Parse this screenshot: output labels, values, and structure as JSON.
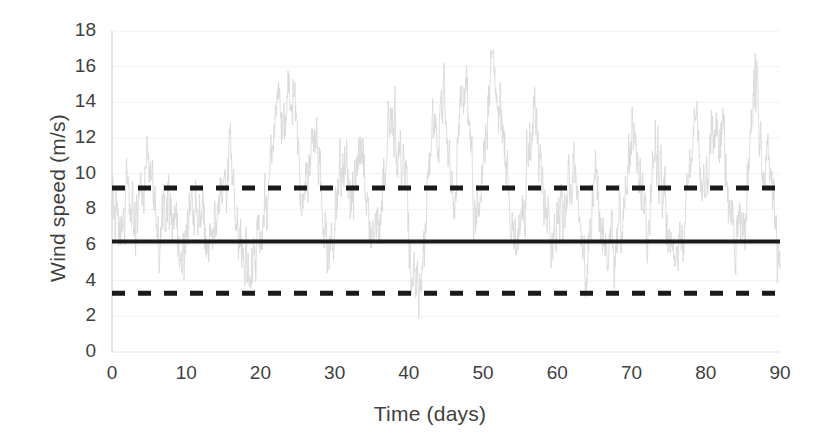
{
  "chart_data": {
    "type": "line",
    "title": "",
    "subtitle": "",
    "xlabel": "Time (days)",
    "ylabel": "Wind speed (m/s)",
    "xlim": [
      0,
      90
    ],
    "ylim": [
      0,
      18
    ],
    "xticks": [
      0,
      10,
      20,
      30,
      40,
      50,
      60,
      70,
      80,
      90
    ],
    "yticks": [
      0,
      2,
      4,
      6,
      8,
      10,
      12,
      14,
      16,
      18
    ],
    "grid": "horizontal-faint",
    "legend": "none",
    "series": [
      {
        "name": "wind-speed-timeseries",
        "style": "solid-thin",
        "color": "#d8d8d8",
        "description": "High-frequency noisy wind speed record over 90 days",
        "x_start": 0,
        "x_end": 90,
        "y_min": 0.1,
        "y_max": 16.9,
        "sample_points_per_day": 24,
        "peaks": [
          {
            "x": 5.2,
            "y": 11.6
          },
          {
            "x": 7.4,
            "y": 10.3
          },
          {
            "x": 11.3,
            "y": 10.1
          },
          {
            "x": 16.1,
            "y": 11.2
          },
          {
            "x": 22.4,
            "y": 13.6
          },
          {
            "x": 23.8,
            "y": 15.5
          },
          {
            "x": 27.6,
            "y": 11.1
          },
          {
            "x": 31.0,
            "y": 11.9
          },
          {
            "x": 33.4,
            "y": 11.2
          },
          {
            "x": 37.6,
            "y": 13.3
          },
          {
            "x": 39.1,
            "y": 11.5
          },
          {
            "x": 43.2,
            "y": 14.1
          },
          {
            "x": 44.6,
            "y": 14.6
          },
          {
            "x": 47.4,
            "y": 14.3
          },
          {
            "x": 51.4,
            "y": 16.8
          },
          {
            "x": 52.3,
            "y": 15.1
          },
          {
            "x": 57.0,
            "y": 11.9
          },
          {
            "x": 62.5,
            "y": 11.0
          },
          {
            "x": 65.2,
            "y": 12.2
          },
          {
            "x": 70.1,
            "y": 11.8
          },
          {
            "x": 73.6,
            "y": 11.0
          },
          {
            "x": 78.4,
            "y": 11.4
          },
          {
            "x": 81.6,
            "y": 11.6
          },
          {
            "x": 86.8,
            "y": 16.7
          },
          {
            "x": 88.2,
            "y": 13.0
          }
        ]
      },
      {
        "name": "mean-line",
        "style": "solid-thick",
        "color": "#1a1a1a",
        "value": 6.2,
        "x_start": 0,
        "x_end": 90
      },
      {
        "name": "upper-bound-line",
        "style": "dashed-thick",
        "color": "#1a1a1a",
        "value": 9.2,
        "x_start": 0,
        "x_end": 90
      },
      {
        "name": "lower-bound-line",
        "style": "dashed-thick",
        "color": "#1a1a1a",
        "value": 3.3,
        "x_start": 0,
        "x_end": 90
      }
    ]
  },
  "axes": {
    "x": {
      "label": "Time (days)",
      "tick_labels": [
        "0",
        "10",
        "20",
        "30",
        "40",
        "50",
        "60",
        "70",
        "80",
        "90"
      ]
    },
    "y": {
      "label": "Wind speed (m/s)",
      "tick_labels": [
        "0",
        "2",
        "4",
        "6",
        "8",
        "10",
        "12",
        "14",
        "16",
        "18"
      ]
    }
  },
  "colors": {
    "series": "#d8d8d8",
    "reference_line": "#1a1a1a",
    "axis": "#6e6e6e",
    "grid": "#f2f2f2",
    "text": "#3f3f3f",
    "background": "#ffffff"
  }
}
